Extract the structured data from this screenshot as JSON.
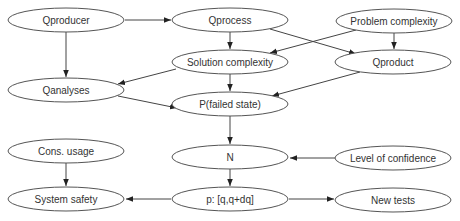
{
  "diagram": {
    "type": "directed-graph",
    "nodes": [
      {
        "id": "qproducer",
        "label": "Qproducer",
        "cx": 66,
        "cy": 20
      },
      {
        "id": "qprocess",
        "label": "Qprocess",
        "cx": 230,
        "cy": 20
      },
      {
        "id": "problem_complexity",
        "label": "Problem complexity",
        "cx": 394,
        "cy": 21
      },
      {
        "id": "solution_complexity",
        "label": "Solution complexity",
        "cx": 230,
        "cy": 62
      },
      {
        "id": "qproduct",
        "label": "Qproduct",
        "cx": 393,
        "cy": 62
      },
      {
        "id": "qanalyses",
        "label": "Qanalyses",
        "cx": 66,
        "cy": 90
      },
      {
        "id": "p_failed_state",
        "label": "P(failed state)",
        "cx": 230,
        "cy": 104
      },
      {
        "id": "n",
        "label": "N",
        "cx": 230,
        "cy": 157
      },
      {
        "id": "level_of_confidence",
        "label": "Level of confidence",
        "cx": 393,
        "cy": 158
      },
      {
        "id": "cons_usage",
        "label": "Cons. usage",
        "cx": 66,
        "cy": 151
      },
      {
        "id": "system_safety",
        "label": "System safety",
        "cx": 66,
        "cy": 199
      },
      {
        "id": "p_interval",
        "label": "p: [q,q+dq]",
        "cx": 230,
        "cy": 199
      },
      {
        "id": "new_tests",
        "label": "New tests",
        "cx": 393,
        "cy": 200
      }
    ],
    "edges": [
      {
        "from": "qproducer",
        "to": "qprocess"
      },
      {
        "from": "qproducer",
        "to": "qanalyses"
      },
      {
        "from": "qprocess",
        "to": "solution_complexity"
      },
      {
        "from": "qprocess",
        "to": "qproduct"
      },
      {
        "from": "problem_complexity",
        "to": "solution_complexity"
      },
      {
        "from": "problem_complexity",
        "to": "qproduct"
      },
      {
        "from": "solution_complexity",
        "to": "qanalyses"
      },
      {
        "from": "solution_complexity",
        "to": "p_failed_state"
      },
      {
        "from": "qanalyses",
        "to": "p_failed_state"
      },
      {
        "from": "qproduct",
        "to": "p_failed_state"
      },
      {
        "from": "p_failed_state",
        "to": "n"
      },
      {
        "from": "level_of_confidence",
        "to": "n"
      },
      {
        "from": "n",
        "to": "p_interval"
      },
      {
        "from": "cons_usage",
        "to": "system_safety"
      },
      {
        "from": "p_interval",
        "to": "system_safety"
      },
      {
        "from": "p_interval",
        "to": "new_tests"
      }
    ]
  }
}
